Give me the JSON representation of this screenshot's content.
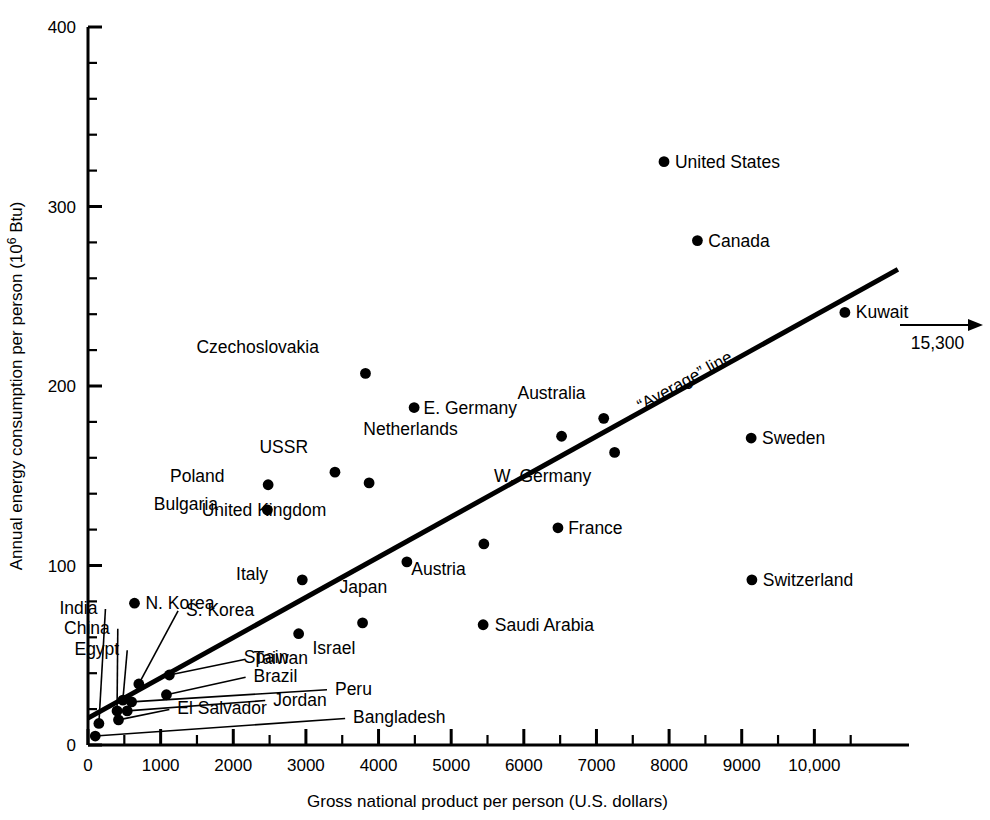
{
  "chart_data": {
    "type": "scatter",
    "title": "",
    "xlabel": "Gross national product per person (U.S. dollars)",
    "ylabel": "Annual energy consumption per person (10⁶ Btu)",
    "xlim": [
      0,
      11000
    ],
    "ylim": [
      0,
      400
    ],
    "grid": false,
    "legend": "none",
    "x_ticks": [
      0,
      1000,
      2000,
      3000,
      4000,
      5000,
      6000,
      7000,
      8000,
      9000,
      10000
    ],
    "x_tick_labels": [
      "0",
      "1000",
      "2000",
      "3000",
      "4000",
      "5000",
      "6000",
      "7000",
      "8000",
      "9000",
      "10,000"
    ],
    "x_minor_step": 500,
    "y_ticks": [
      0,
      100,
      200,
      300,
      400
    ],
    "y_tick_labels": [
      "0",
      "100",
      "200",
      "300",
      "400"
    ],
    "y_minor_step": 20,
    "points": [
      {
        "name": "Bangladesh",
        "x": 100,
        "y": 5,
        "label_x": 3650,
        "label_y": 12,
        "leader": true
      },
      {
        "name": "India",
        "x": 150,
        "y": 12,
        "label_x": 130,
        "label_y": 73,
        "leader": true
      },
      {
        "name": "China",
        "x": 400,
        "y": 19,
        "label_x": 300,
        "label_y": 62,
        "leader": true
      },
      {
        "name": "El Salvador",
        "x": 420,
        "y": 14,
        "label_x": 1230,
        "label_y": 17,
        "leader": true
      },
      {
        "name": "Egypt",
        "x": 480,
        "y": 25,
        "label_x": 430,
        "label_y": 50,
        "leader": true
      },
      {
        "name": "Jordan",
        "x": 540,
        "y": 19,
        "label_x": 2550,
        "label_y": 22,
        "leader": true
      },
      {
        "name": "Peru",
        "x": 600,
        "y": 24,
        "label_x": 3400,
        "label_y": 28,
        "leader": true
      },
      {
        "name": "S. Korea",
        "x": 700,
        "y": 34,
        "label_x": 1350,
        "label_y": 72,
        "leader": true
      },
      {
        "name": "N. Korea",
        "x": 640,
        "y": 79,
        "label_x": 790,
        "label_y": 79,
        "leader": false
      },
      {
        "name": "Brazil",
        "x": 1080,
        "y": 28,
        "label_x": 2280,
        "label_y": 35,
        "leader": true
      },
      {
        "name": "Taiwan",
        "x": 1120,
        "y": 39,
        "label_x": 2280,
        "label_y": 45,
        "leader": true
      },
      {
        "name": "Spain",
        "x": 2900,
        "y": 62,
        "label_x": 2760,
        "label_y": 49,
        "leader": false
      },
      {
        "name": "Italy",
        "x": 2950,
        "y": 92,
        "label_x": 2480,
        "label_y": 95,
        "leader": false
      },
      {
        "name": "Bulgaria",
        "x": 2470,
        "y": 131,
        "label_x": 1790,
        "label_y": 134,
        "leader": false
      },
      {
        "name": "Poland",
        "x": 2480,
        "y": 145,
        "label_x": 1880,
        "label_y": 150,
        "leader": false
      },
      {
        "name": "USSR",
        "x": 3400,
        "y": 152,
        "label_x": 3030,
        "label_y": 166,
        "leader": false
      },
      {
        "name": "Czechoslovakia",
        "x": 3820,
        "y": 207,
        "label_x": 3180,
        "label_y": 222,
        "leader": false
      },
      {
        "name": "Israel",
        "x": 3780,
        "y": 68,
        "label_x": 3680,
        "label_y": 54,
        "leader": false
      },
      {
        "name": "United Kingdom",
        "x": 3870,
        "y": 146,
        "label_x": 3280,
        "label_y": 131,
        "leader": false
      },
      {
        "name": "E. Germany",
        "x": 4490,
        "y": 188,
        "label_x": 4620,
        "label_y": 188,
        "leader": false
      },
      {
        "name": "Japan",
        "x": 4390,
        "y": 102,
        "label_x": 4120,
        "label_y": 88,
        "leader": false
      },
      {
        "name": "Austria",
        "x": 5450,
        "y": 112,
        "label_x": 5200,
        "label_y": 98,
        "leader": false
      },
      {
        "name": "Saudi Arabia",
        "x": 5440,
        "y": 67,
        "label_x": 5600,
        "label_y": 67,
        "leader": false
      },
      {
        "name": "France",
        "x": 6470,
        "y": 121,
        "label_x": 6610,
        "label_y": 121,
        "leader": false
      },
      {
        "name": "Netherlands",
        "x": 6520,
        "y": 172,
        "label_x": 5090,
        "label_y": 176,
        "leader": false
      },
      {
        "name": "Australia",
        "x": 7100,
        "y": 182,
        "label_x": 6850,
        "label_y": 196,
        "leader": false
      },
      {
        "name": "W. Germany",
        "x": 7250,
        "y": 163,
        "label_x": 6930,
        "label_y": 150,
        "leader": false
      },
      {
        "name": "United States",
        "x": 7930,
        "y": 325,
        "label_x": 8080,
        "label_y": 325,
        "leader": false
      },
      {
        "name": "Canada",
        "x": 8390,
        "y": 281,
        "label_x": 8540,
        "label_y": 281,
        "leader": false
      },
      {
        "name": "Sweden",
        "x": 9130,
        "y": 171,
        "label_x": 9280,
        "label_y": 171,
        "leader": false
      },
      {
        "name": "Switzerland",
        "x": 9140,
        "y": 92,
        "label_x": 9290,
        "label_y": 92,
        "leader": false
      },
      {
        "name": "Kuwait",
        "x": 10420,
        "y": 241,
        "label_x": 10570,
        "label_y": 241,
        "leader": false
      }
    ],
    "average_line": {
      "label": "“Average” line",
      "x1": 0,
      "y1": 15,
      "x2": 11150,
      "y2": 265
    },
    "annotations": [
      {
        "name": "kuwait-offscale-arrow",
        "label": "15,300"
      }
    ]
  },
  "colors": {
    "ink": "#000000",
    "background": "#ffffff",
    "leader": "#000000"
  }
}
